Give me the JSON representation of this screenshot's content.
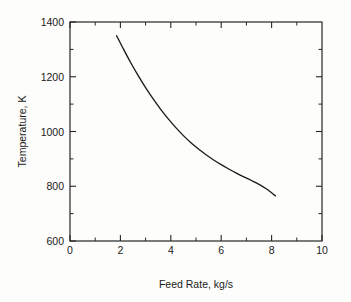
{
  "chart_data": {
    "type": "line",
    "title": "",
    "xlabel": "Feed Rate, kg/s",
    "ylabel": "Temperature, K",
    "xlim": [
      0,
      10
    ],
    "ylim": [
      600,
      1400
    ],
    "xticks": [
      0,
      2,
      4,
      6,
      8,
      10
    ],
    "xtick_labels": [
      "0",
      "2",
      "4",
      "6",
      "8",
      "10"
    ],
    "xminor_ticks": [
      1,
      3,
      5,
      7,
      9
    ],
    "yticks": [
      600,
      800,
      1000,
      1200,
      1400
    ],
    "ytick_labels": [
      "600",
      "800",
      "1000",
      "1200",
      "1400"
    ],
    "yminor_ticks": [
      700,
      900,
      1100,
      1300
    ],
    "grid": false,
    "legend": false,
    "tick_direction": "in",
    "series": [
      {
        "name": "Temperature vs Feed Rate",
        "color": "#1c1c1c",
        "x": [
          1.85,
          2.1,
          2.4,
          2.7,
          3.0,
          3.3,
          3.6,
          3.9,
          4.2,
          4.5,
          4.8,
          5.1,
          5.4,
          5.7,
          6.0,
          6.3,
          6.6,
          6.9,
          7.2,
          7.5,
          7.8,
          8.15
        ],
        "y": [
          1350,
          1305,
          1253,
          1205,
          1160,
          1119,
          1081,
          1046,
          1014,
          985,
          959,
          936,
          915,
          896,
          879,
          863,
          848,
          834,
          821,
          807,
          790,
          765
        ]
      }
    ]
  },
  "figure": {
    "xlabel": "Feed Rate, kg/s",
    "ylabel": "Temperature, K",
    "xtick_0": "0",
    "xtick_1": "2",
    "xtick_2": "4",
    "xtick_3": "6",
    "xtick_4": "8",
    "xtick_5": "10",
    "ytick_0": "600",
    "ytick_1": "800",
    "ytick_2": "1000",
    "ytick_3": "1200",
    "ytick_4": "1400"
  },
  "colors": {
    "background": "#fdfdfb",
    "axis": "#262626",
    "curve": "#1c1c1c",
    "text": "#1a1a1a"
  }
}
